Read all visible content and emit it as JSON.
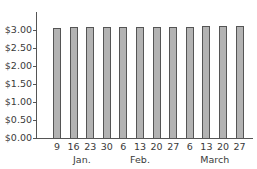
{
  "chart_data": {
    "type": "bar",
    "title": "",
    "xlabel": "",
    "ylabel": "",
    "ylim": [
      0,
      3.5
    ],
    "y_ticks": [
      "$0.00",
      "$0.50",
      "$1.00",
      "$1.50",
      "$2.00",
      "$2.50",
      "$3.00"
    ],
    "categories": [
      "9",
      "16",
      "23",
      "30",
      "6",
      "13",
      "20",
      "27",
      "6",
      "13",
      "20",
      "27"
    ],
    "month_labels": [
      {
        "label": "Jan.",
        "center_index": 1.5
      },
      {
        "label": "Feb.",
        "center_index": 5
      },
      {
        "label": "March",
        "center_index": 9.5
      }
    ],
    "values": [
      3.06,
      3.07,
      3.07,
      3.07,
      3.07,
      3.08,
      3.08,
      3.09,
      3.09,
      3.1,
      3.1,
      3.1
    ],
    "grid": false,
    "legend": null,
    "bar_color": "#b3b3b3",
    "bar_edge_color": "#555555"
  }
}
